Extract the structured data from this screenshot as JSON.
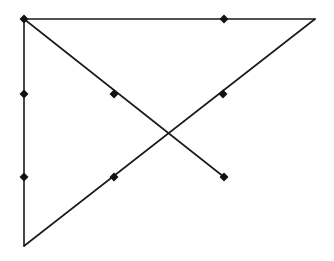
{
  "diagram": {
    "type": "line-figure",
    "stroke_color": "#1a1a1a",
    "marker_color": "#111111",
    "background": "#ffffff",
    "lines": [
      {
        "name": "top-edge",
        "x1": 24,
        "y1": 19,
        "x2": 315,
        "y2": 19
      },
      {
        "name": "left-edge",
        "x1": 24,
        "y1": 19,
        "x2": 24,
        "y2": 246
      },
      {
        "name": "hypotenuse",
        "x1": 24,
        "y1": 246,
        "x2": 315,
        "y2": 19
      },
      {
        "name": "diagonal",
        "x1": 24,
        "y1": 19,
        "x2": 224,
        "y2": 177
      }
    ],
    "points": [
      {
        "name": "top-left-corner",
        "x": 24,
        "y": 19
      },
      {
        "name": "top-edge-point",
        "x": 224,
        "y": 19
      },
      {
        "name": "left-edge-upper-point",
        "x": 24,
        "y": 94
      },
      {
        "name": "left-edge-lower-point",
        "x": 24,
        "y": 177
      },
      {
        "name": "diagonal-mid-point",
        "x": 114,
        "y": 94
      },
      {
        "name": "diagonal-end-point",
        "x": 224,
        "y": 177
      },
      {
        "name": "hypotenuse-upper-point",
        "x": 223,
        "y": 94
      },
      {
        "name": "hypotenuse-lower-point",
        "x": 114,
        "y": 177
      }
    ]
  }
}
